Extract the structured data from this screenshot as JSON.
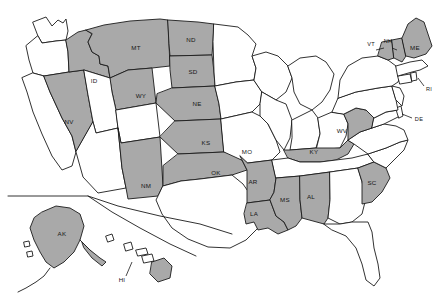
{
  "map": {
    "title": "United States state map",
    "colors": {
      "selected_fill": "#a9a9a9",
      "unselected_fill": "#ffffff",
      "outline": "#1b1b1b",
      "background": "#ffffff"
    },
    "legend": {
      "selected_meaning": "shaded state",
      "unselected_meaning": "unshaded state"
    },
    "selected_count": 22,
    "states": [
      {
        "code": "WA",
        "label": "",
        "selected": false
      },
      {
        "code": "OR",
        "label": "",
        "selected": false
      },
      {
        "code": "CA",
        "label": "",
        "selected": false
      },
      {
        "code": "NV",
        "label": "NV",
        "selected": true
      },
      {
        "code": "ID",
        "label": "ID",
        "selected": true
      },
      {
        "code": "MT",
        "label": "MT",
        "selected": true
      },
      {
        "code": "WY",
        "label": "WY",
        "selected": true
      },
      {
        "code": "UT",
        "label": "",
        "selected": false
      },
      {
        "code": "AZ",
        "label": "",
        "selected": false
      },
      {
        "code": "CO",
        "label": "",
        "selected": false
      },
      {
        "code": "NM",
        "label": "NM",
        "selected": true
      },
      {
        "code": "ND",
        "label": "ND",
        "selected": true
      },
      {
        "code": "SD",
        "label": "SD",
        "selected": true
      },
      {
        "code": "NE",
        "label": "NE",
        "selected": true
      },
      {
        "code": "KS",
        "label": "KS",
        "selected": true
      },
      {
        "code": "OK",
        "label": "OK",
        "selected": true
      },
      {
        "code": "TX",
        "label": "",
        "selected": false
      },
      {
        "code": "MN",
        "label": "",
        "selected": false
      },
      {
        "code": "IA",
        "label": "",
        "selected": false
      },
      {
        "code": "MO",
        "label": "MO",
        "selected": false
      },
      {
        "code": "AR",
        "label": "AR",
        "selected": true
      },
      {
        "code": "LA",
        "label": "LA",
        "selected": true
      },
      {
        "code": "WI",
        "label": "",
        "selected": false
      },
      {
        "code": "IL",
        "label": "",
        "selected": false
      },
      {
        "code": "MI",
        "label": "",
        "selected": false
      },
      {
        "code": "IN",
        "label": "",
        "selected": false
      },
      {
        "code": "OH",
        "label": "",
        "selected": false
      },
      {
        "code": "KY",
        "label": "KY",
        "selected": true
      },
      {
        "code": "TN",
        "label": "",
        "selected": false
      },
      {
        "code": "MS",
        "label": "MS",
        "selected": true
      },
      {
        "code": "AL",
        "label": "AL",
        "selected": true
      },
      {
        "code": "GA",
        "label": "",
        "selected": false
      },
      {
        "code": "FL",
        "label": "",
        "selected": false
      },
      {
        "code": "SC",
        "label": "SC",
        "selected": true
      },
      {
        "code": "NC",
        "label": "",
        "selected": false
      },
      {
        "code": "VA",
        "label": "",
        "selected": false
      },
      {
        "code": "WV",
        "label": "WV",
        "selected": true
      },
      {
        "code": "MD",
        "label": "",
        "selected": false
      },
      {
        "code": "DE",
        "label": "DE",
        "selected": false
      },
      {
        "code": "PA",
        "label": "",
        "selected": false
      },
      {
        "code": "NJ",
        "label": "",
        "selected": false
      },
      {
        "code": "NY",
        "label": "",
        "selected": false
      },
      {
        "code": "CT",
        "label": "",
        "selected": false
      },
      {
        "code": "RI",
        "label": "RI",
        "selected": false
      },
      {
        "code": "MA",
        "label": "",
        "selected": false
      },
      {
        "code": "VT",
        "label": "VT",
        "selected": true
      },
      {
        "code": "NH",
        "label": "NH",
        "selected": true
      },
      {
        "code": "ME",
        "label": "ME",
        "selected": true
      },
      {
        "code": "AK",
        "label": "AK",
        "selected": true
      },
      {
        "code": "HI",
        "label": "HI",
        "selected": true
      }
    ],
    "labels": {
      "MT": "MT",
      "ND": "ND",
      "SD": "SD",
      "ID": "ID",
      "WY": "WY",
      "NV": "NV",
      "NE": "NE",
      "KS": "KS",
      "MO": "MO",
      "NM": "NM",
      "OK": "OK",
      "AR": "AR",
      "LA": "LA",
      "MS": "MS",
      "AL": "AL",
      "KY": "KY",
      "WV": "WV",
      "SC": "SC",
      "VT": "VT",
      "NH": "NH",
      "ME": "ME",
      "RI": "RI",
      "DE": "DE",
      "AK": "AK",
      "HI": "HI"
    }
  }
}
